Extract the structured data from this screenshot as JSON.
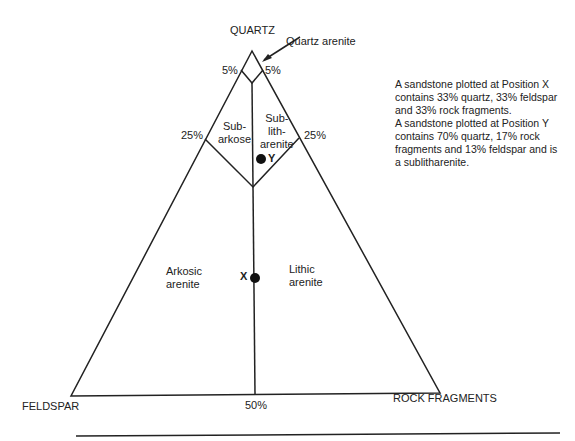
{
  "vertices": {
    "top": "QUARTZ",
    "left": "FELDSPAR",
    "right": "ROCK FRAGMENTS"
  },
  "callout": "Quartz arenite",
  "ticks": {
    "top_left": "5%",
    "top_right": "5%",
    "mid_left": "25%",
    "mid_right": "25%",
    "bottom": "50%"
  },
  "fields": {
    "subarkose": [
      "Sub-",
      "arkose"
    ],
    "sublitharenite": [
      "Sub-",
      "lith-",
      "arenite"
    ],
    "arkosic": [
      "Arkosic",
      "arenite"
    ],
    "lithic": [
      "Lithic",
      "arenite"
    ]
  },
  "points": {
    "x": "X",
    "y": "Y"
  },
  "note": [
    "A sandstone plotted at Position X",
    "contains 33% quartz, 33% feldspar",
    "and 33% rock fragments.",
    "A sandstone plotted at Position Y",
    "contains 70% quartz, 17%  rock",
    "fragments and 13% feldspar and is",
    "a sublitharenite."
  ]
}
